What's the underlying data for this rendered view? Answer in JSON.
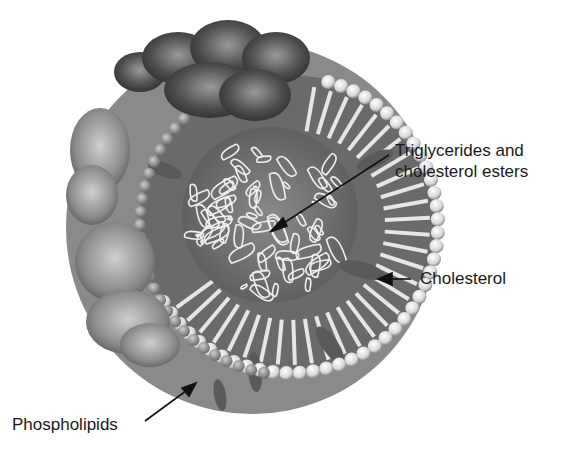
{
  "diagram": {
    "labels": {
      "triglycerides_line1": "Triglycerides and",
      "triglycerides_line2": "cholesterol esters",
      "cholesterol": "Cholesterol",
      "phospholipids": "Phospholipids"
    },
    "colors": {
      "background": "#ffffff",
      "text": "#1a1a1a",
      "protein_dark": "#3a3a3a",
      "protein_mid": "#6e6e6e",
      "shell_light": "#f2f2f2",
      "core_fill": "#7a7a7a"
    }
  }
}
